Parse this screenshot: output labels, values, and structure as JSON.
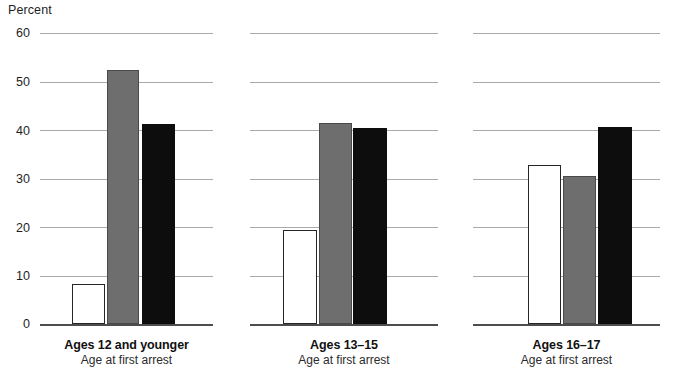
{
  "chart_data": {
    "type": "bar",
    "title": "",
    "subtitle": "",
    "ylabel": "Percent",
    "xlabel": "Age at first arrest",
    "ylim": [
      0,
      60
    ],
    "yticks": [
      0,
      10,
      20,
      30,
      40,
      50,
      60
    ],
    "grid": true,
    "legend_position": "none",
    "panels": [
      {
        "label": "Ages 12 and younger",
        "sublabel": "Age at first arrest",
        "values": [
          8.2,
          52.3,
          41.2
        ]
      },
      {
        "label": "Ages 13–15",
        "sublabel": "Age at first arrest",
        "values": [
          19.4,
          41.5,
          40.5
        ]
      },
      {
        "label": "Ages 16–17",
        "sublabel": "Age at first arrest",
        "values": [
          32.7,
          30.6,
          40.6
        ]
      }
    ],
    "series": [
      {
        "name": "series-1",
        "style": "white",
        "color": "#ffffff",
        "values": [
          8.2,
          19.4,
          32.7
        ]
      },
      {
        "name": "series-2",
        "style": "gray",
        "color": "#6e6e6e",
        "values": [
          52.3,
          41.5,
          30.6
        ]
      },
      {
        "name": "series-3",
        "style": "black",
        "color": "#0d0d0d",
        "values": [
          41.2,
          40.5,
          40.6
        ]
      }
    ],
    "categories": [
      "Ages 12 and younger",
      "Ages 13–15",
      "Ages 16–17"
    ]
  },
  "ticks": {
    "t0": "0",
    "t10": "10",
    "t20": "20",
    "t30": "30",
    "t40": "40",
    "t50": "50",
    "t60": "60"
  }
}
